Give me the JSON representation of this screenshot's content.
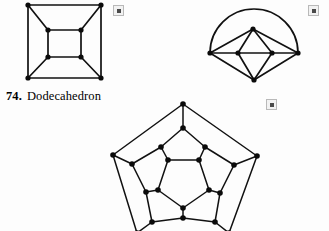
{
  "page": {
    "width": 329,
    "height": 231,
    "background": "#fdfdfd",
    "ink_color": "#111111"
  },
  "caption": {
    "number": "74.",
    "name": "Dodecahedron"
  },
  "markers": [
    {
      "name": "marker-top-left",
      "x": 113,
      "y": 5,
      "glyph": "filled-square"
    },
    {
      "name": "marker-top-right",
      "x": 308,
      "y": 5,
      "glyph": "filled-square"
    },
    {
      "name": "marker-middle",
      "x": 266,
      "y": 99,
      "glyph": "filled-square"
    }
  ],
  "figures": [
    {
      "id": "cube-graph",
      "label": "cube-graph",
      "x": 22,
      "y": 0,
      "width": 86,
      "height": 86,
      "vertex_radius": 2.6,
      "vertices": [
        {
          "id": "o1",
          "x": 6,
          "y": 5
        },
        {
          "id": "o2",
          "x": 79,
          "y": 5
        },
        {
          "id": "o3",
          "x": 79,
          "y": 78
        },
        {
          "id": "o4",
          "x": 6,
          "y": 78
        },
        {
          "id": "i1",
          "x": 26,
          "y": 30
        },
        {
          "id": "i2",
          "x": 59,
          "y": 30
        },
        {
          "id": "i3",
          "x": 59,
          "y": 57
        },
        {
          "id": "i4",
          "x": 26,
          "y": 57
        }
      ],
      "edges": [
        [
          "o1",
          "o2"
        ],
        [
          "o2",
          "o3"
        ],
        [
          "o3",
          "o4"
        ],
        [
          "o4",
          "o1"
        ],
        [
          "i1",
          "i2"
        ],
        [
          "i2",
          "i3"
        ],
        [
          "i3",
          "i4"
        ],
        [
          "i4",
          "i1"
        ],
        [
          "o1",
          "i1"
        ],
        [
          "o2",
          "i2"
        ],
        [
          "o3",
          "i3"
        ],
        [
          "o4",
          "i4"
        ]
      ]
    },
    {
      "id": "octahedron-graph",
      "label": "octahedron-graph",
      "x": 203,
      "y": 6,
      "width": 103,
      "height": 82,
      "vertex_radius": 2.6,
      "vertices": [
        {
          "id": "L",
          "x": 7,
          "y": 47
        },
        {
          "id": "R",
          "x": 95,
          "y": 47
        },
        {
          "id": "T",
          "x": 50,
          "y": 23
        },
        {
          "id": "B",
          "x": 51,
          "y": 74
        },
        {
          "id": "CL",
          "x": 35,
          "y": 47
        },
        {
          "id": "CR",
          "x": 69,
          "y": 47
        }
      ],
      "edges": [
        [
          "L",
          "CL"
        ],
        [
          "CL",
          "CR"
        ],
        [
          "CR",
          "R"
        ],
        [
          "L",
          "T"
        ],
        [
          "T",
          "R"
        ],
        [
          "L",
          "B"
        ],
        [
          "B",
          "R"
        ],
        [
          "T",
          "CL"
        ],
        [
          "T",
          "CR"
        ],
        [
          "B",
          "CL"
        ],
        [
          "B",
          "CR"
        ]
      ],
      "arcs": [
        {
          "from": "L",
          "to": "R",
          "sweep_height": 44
        }
      ]
    },
    {
      "id": "dodecahedron-graph",
      "label": "dodecahedron-graph",
      "x": 104,
      "y": 100,
      "width": 160,
      "height": 135,
      "vertex_radius": 2.8,
      "vertices": [
        {
          "id": "A1",
          "x": 79,
          "y": 4
        },
        {
          "id": "A2",
          "x": 153,
          "y": 56
        },
        {
          "id": "A3",
          "x": 125,
          "y": 133
        },
        {
          "id": "A4",
          "x": 33,
          "y": 133
        },
        {
          "id": "A5",
          "x": 9,
          "y": 55
        },
        {
          "id": "B1",
          "x": 79,
          "y": 28
        },
        {
          "id": "B2",
          "x": 130,
          "y": 65
        },
        {
          "id": "B3",
          "x": 111,
          "y": 122
        },
        {
          "id": "B4",
          "x": 48,
          "y": 122
        },
        {
          "id": "B5",
          "x": 28,
          "y": 64
        },
        {
          "id": "C1",
          "x": 57,
          "y": 47
        },
        {
          "id": "C2",
          "x": 101,
          "y": 47
        },
        {
          "id": "C3",
          "x": 116,
          "y": 93
        },
        {
          "id": "C4",
          "x": 79,
          "y": 118
        },
        {
          "id": "C5",
          "x": 42,
          "y": 92
        },
        {
          "id": "D1",
          "x": 64,
          "y": 60
        },
        {
          "id": "D2",
          "x": 95,
          "y": 60
        },
        {
          "id": "D3",
          "x": 105,
          "y": 90
        },
        {
          "id": "D4",
          "x": 79,
          "y": 108
        },
        {
          "id": "D5",
          "x": 54,
          "y": 90
        }
      ],
      "edges": [
        [
          "A1",
          "A2"
        ],
        [
          "A2",
          "A3"
        ],
        [
          "A3",
          "A4"
        ],
        [
          "A4",
          "A5"
        ],
        [
          "A5",
          "A1"
        ],
        [
          "A1",
          "B1"
        ],
        [
          "A2",
          "B2"
        ],
        [
          "A3",
          "B3"
        ],
        [
          "A4",
          "B4"
        ],
        [
          "A5",
          "B5"
        ],
        [
          "B1",
          "C1"
        ],
        [
          "B1",
          "C2"
        ],
        [
          "B2",
          "C2"
        ],
        [
          "B2",
          "C3"
        ],
        [
          "B3",
          "C3"
        ],
        [
          "B3",
          "C4"
        ],
        [
          "B4",
          "C4"
        ],
        [
          "B4",
          "C5"
        ],
        [
          "B5",
          "C5"
        ],
        [
          "B5",
          "C1"
        ],
        [
          "C1",
          "D1"
        ],
        [
          "C2",
          "D2"
        ],
        [
          "C3",
          "D3"
        ],
        [
          "C4",
          "D4"
        ],
        [
          "C5",
          "D5"
        ],
        [
          "D1",
          "D2"
        ],
        [
          "D2",
          "D3"
        ],
        [
          "D3",
          "D4"
        ],
        [
          "D4",
          "D5"
        ],
        [
          "D5",
          "D1"
        ]
      ]
    }
  ]
}
